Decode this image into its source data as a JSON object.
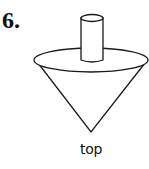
{
  "problem": {
    "number": "6.",
    "caption": "top"
  },
  "figure": {
    "shape": "spinning top",
    "parts": [
      "cylinder-handle",
      "disc-ellipse",
      "cone"
    ],
    "stroke_color": "#1a1a1a",
    "fill_color": "#ffffff"
  }
}
